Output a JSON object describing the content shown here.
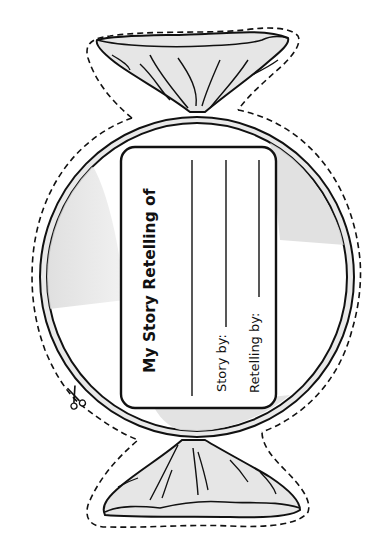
{
  "card": {
    "title": "My Story Retelling of",
    "story_by_label": "Story by:",
    "retelling_by_label": "Retelling by:"
  },
  "icons": {
    "cut_guide": "scissors-icon"
  },
  "colors": {
    "ink": "#111111",
    "wrapper_fill": "#e6e6e6",
    "rim_fill": "#e9e9e9",
    "shine_fill": "#dcdcdc",
    "card_fill": "#ffffff",
    "background": "#ffffff"
  }
}
